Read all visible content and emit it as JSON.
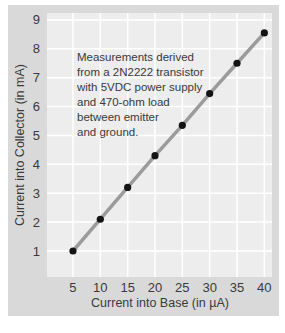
{
  "chart_data": {
    "type": "line",
    "markers": true,
    "x": [
      5,
      10,
      15,
      20,
      25,
      30,
      35,
      40
    ],
    "values": [
      1.0,
      2.1,
      3.2,
      4.3,
      5.35,
      6.45,
      7.5,
      8.55
    ],
    "x_ticks": [
      5,
      10,
      15,
      20,
      25,
      30,
      35,
      40
    ],
    "y_ticks": [
      1,
      2,
      3,
      4,
      5,
      6,
      7,
      8,
      9
    ],
    "xlim": [
      0.25,
      41.4
    ],
    "ylim": [
      0.1,
      9.24
    ],
    "xlabel": "Current into Base (in µA)",
    "ylabel": "Current into Collector (in mA)",
    "annotation": "Measurements derived\nfrom a 2N2222 transistor\nwith 5VDC power supply\nand 470-ohm load\nbetween emitter\nand ground.",
    "grid": true,
    "legend": "none",
    "colors": {
      "panel_bg": "#d9d9d9",
      "plot_bg": "#ededed",
      "gridline": "#ffffff",
      "line": "#9b9b9b",
      "point": "#141414",
      "text": "#3a3a3a"
    }
  }
}
